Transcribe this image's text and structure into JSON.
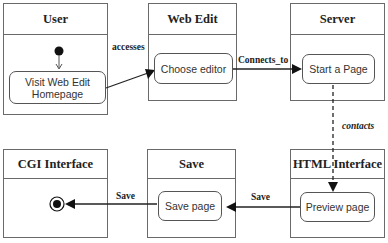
{
  "diagram": {
    "type": "activity-swimlane",
    "lanes": [
      {
        "id": "user",
        "title": "User"
      },
      {
        "id": "web_edit",
        "title": "Web Edit"
      },
      {
        "id": "server",
        "title": "Server"
      },
      {
        "id": "cgi",
        "title": "CGI Interface"
      },
      {
        "id": "save",
        "title": "Save"
      },
      {
        "id": "html",
        "title": "HTML Interface"
      }
    ],
    "activities": {
      "visit_line1": "Visit Web Edit",
      "visit_line2": "Homepage",
      "choose_editor": "Choose editor",
      "start_page": "Start a Page",
      "preview_page": "Preview page",
      "save_page": "Save page"
    },
    "edges": [
      {
        "from": "Visit Web Edit Homepage",
        "to": "Choose editor",
        "label": "accesses",
        "style": "solid"
      },
      {
        "from": "Choose editor",
        "to": "Start a Page",
        "label": "Connects_to",
        "style": "solid"
      },
      {
        "from": "Start a Page",
        "to": "Preview page",
        "label": "contacts",
        "style": "dashed"
      },
      {
        "from": "Preview page",
        "to": "Save page",
        "label": "Save",
        "style": "solid"
      },
      {
        "from": "Save page",
        "to": "final-node",
        "label": "Save",
        "style": "solid"
      }
    ],
    "edge_labels": {
      "accesses": "accesses",
      "connects_to": "Connects_to",
      "contacts": "contacts",
      "save_right": "Save",
      "save_left": "Save"
    }
  }
}
